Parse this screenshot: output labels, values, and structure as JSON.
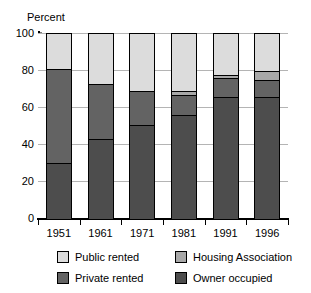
{
  "chart_data": {
    "type": "bar",
    "subtype": "stacked-bar-100-percent",
    "title": "",
    "xlabel": "",
    "ylabel": "Percent",
    "ylim": [
      0,
      100
    ],
    "yticks": [
      0,
      20,
      40,
      60,
      80,
      100
    ],
    "grid": true,
    "legend_position": "bottom",
    "categories": [
      "1951",
      "1961",
      "1971",
      "1981",
      "1991",
      "1996"
    ],
    "series": [
      {
        "name": "Owner occupied",
        "color": "#4d4d4d",
        "values": [
          30,
          43,
          51,
          56,
          66,
          66
        ]
      },
      {
        "name": "Private rented",
        "color": "#636363",
        "values": [
          51,
          30,
          18,
          11,
          10,
          9
        ]
      },
      {
        "name": "Housing Association",
        "color": "#a8a8a8",
        "values": [
          0,
          0,
          0,
          2,
          2,
          5
        ]
      },
      {
        "name": "Public rented",
        "color": "#dcdcdc",
        "values": [
          19,
          27,
          31,
          31,
          22,
          20
        ]
      }
    ],
    "stack_order_bottom_to_top": [
      "Owner occupied",
      "Private rented",
      "Housing Association",
      "Public rented"
    ]
  },
  "axis": {
    "y_title": "Percent",
    "y_tick_labels": [
      "100",
      "80",
      "60",
      "40",
      "20",
      "0"
    ],
    "x_tick_labels": [
      "1951",
      "1961",
      "1971",
      "1981",
      "1991",
      "1996"
    ]
  },
  "legend": {
    "items": [
      {
        "label": "Public rented",
        "color": "#dcdcdc"
      },
      {
        "label": "Housing Association",
        "color": "#a8a8a8"
      },
      {
        "label": "Private rented",
        "color": "#636363"
      },
      {
        "label": "Owner occupied",
        "color": "#4d4d4d"
      }
    ]
  },
  "colors": {
    "public_rented": "#dcdcdc",
    "housing_association": "#a8a8a8",
    "private_rented": "#636363",
    "owner_occupied": "#4d4d4d",
    "axis": "#000000",
    "grid": "#b4b4b4",
    "background": "#ffffff"
  }
}
